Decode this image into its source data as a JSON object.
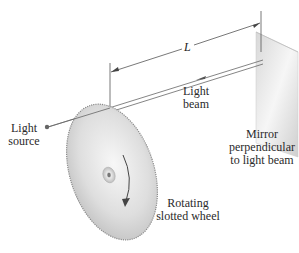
{
  "diagram": {
    "labels": {
      "distance": "L",
      "light_beam_line1": "Light",
      "light_beam_line2": "beam",
      "light_source_line1": "Light",
      "light_source_line2": "source",
      "mirror_line1": "Mirror",
      "mirror_line2": "perpendicular",
      "mirror_line3": "to light beam",
      "wheel_line1": "Rotating",
      "wheel_line2": "slotted wheel"
    },
    "colors": {
      "line": "#555555",
      "wheel_light": "#f2f2f2",
      "wheel_dark": "#bdbdbd",
      "mirror_light": "#f4f4f4",
      "mirror_dark": "#cfcfcf",
      "source_dot": "#666666"
    }
  }
}
